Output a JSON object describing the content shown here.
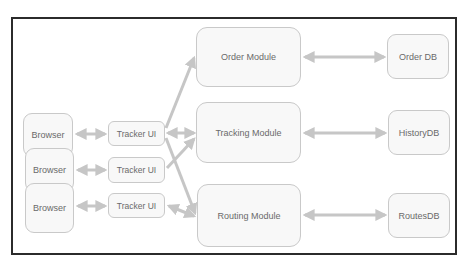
{
  "diagram": {
    "browsers": [
      {
        "label": "Browser"
      },
      {
        "label": "Browser"
      },
      {
        "label": "Browser"
      }
    ],
    "tracker_uis": [
      {
        "label": "Tracker UI"
      },
      {
        "label": "Tracker UI"
      },
      {
        "label": "Tracker UI"
      }
    ],
    "modules": [
      {
        "label": "Order Module"
      },
      {
        "label": "Tracking Module"
      },
      {
        "label": "Routing Module"
      }
    ],
    "databases": [
      {
        "label": "Order DB"
      },
      {
        "label": "HistoryDB"
      },
      {
        "label": "RoutesDB"
      }
    ],
    "connections": [
      {
        "from": "Browser 1",
        "to": "Tracker UI 1",
        "type": "bidirectional"
      },
      {
        "from": "Browser 2",
        "to": "Tracker UI 2",
        "type": "bidirectional"
      },
      {
        "from": "Browser 3",
        "to": "Tracker UI 3",
        "type": "bidirectional"
      },
      {
        "from": "Tracker UI 1",
        "to": "Order Module",
        "type": "directed"
      },
      {
        "from": "Tracker UI 1",
        "to": "Tracking Module",
        "type": "bidirectional"
      },
      {
        "from": "Tracker UI 1",
        "to": "Routing Module",
        "type": "directed"
      },
      {
        "from": "Tracker UI 2",
        "to": "Tracking Module",
        "type": "directed"
      },
      {
        "from": "Tracker UI 3",
        "to": "Routing Module",
        "type": "bidirectional"
      },
      {
        "from": "Order Module",
        "to": "Order DB",
        "type": "bidirectional"
      },
      {
        "from": "Tracking Module",
        "to": "HistoryDB",
        "type": "bidirectional"
      },
      {
        "from": "Routing Module",
        "to": "RoutesDB",
        "type": "bidirectional"
      }
    ],
    "colors": {
      "frame": "#2b2b2b",
      "box_border": "#c9c9c9",
      "box_fill": "#f8f8f8",
      "text": "#6a6a6a",
      "arrow": "#c6c6c6"
    }
  }
}
